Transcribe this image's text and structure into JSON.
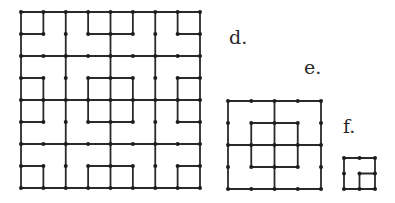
{
  "figures": {
    "d": {
      "label": "d.",
      "grid": {
        "n": 8,
        "x0": 21,
        "y0": 12,
        "x1": 200,
        "y1": 188
      },
      "segments": [
        [
          0,
          0,
          8,
          0
        ],
        [
          0,
          8,
          8,
          8
        ],
        [
          0,
          0,
          0,
          8
        ],
        [
          8,
          0,
          8,
          8
        ],
        [
          0,
          2,
          8,
          2
        ],
        [
          0,
          4,
          8,
          4
        ],
        [
          0,
          6,
          8,
          6
        ],
        [
          2,
          0,
          2,
          8
        ],
        [
          4,
          0,
          4,
          8
        ],
        [
          6,
          0,
          6,
          8
        ],
        [
          1,
          0,
          1,
          1
        ],
        [
          0,
          1,
          1,
          1
        ],
        [
          3,
          0,
          3,
          1
        ],
        [
          3,
          1,
          4,
          1
        ],
        [
          5,
          0,
          5,
          1
        ],
        [
          4,
          1,
          5,
          1
        ],
        [
          7,
          0,
          7,
          1
        ],
        [
          7,
          1,
          8,
          1
        ],
        [
          0,
          3,
          1,
          3
        ],
        [
          1,
          3,
          1,
          4
        ],
        [
          3,
          3,
          4,
          3
        ],
        [
          3,
          3,
          3,
          4
        ],
        [
          4,
          3,
          5,
          3
        ],
        [
          5,
          3,
          5,
          4
        ],
        [
          7,
          3,
          8,
          3
        ],
        [
          7,
          3,
          7,
          4
        ],
        [
          1,
          4,
          1,
          5
        ],
        [
          0,
          5,
          1,
          5
        ],
        [
          3,
          4,
          3,
          5
        ],
        [
          3,
          5,
          4,
          5
        ],
        [
          5,
          4,
          5,
          5
        ],
        [
          4,
          5,
          5,
          5
        ],
        [
          7,
          4,
          7,
          5
        ],
        [
          7,
          5,
          8,
          5
        ],
        [
          0,
          7,
          1,
          7
        ],
        [
          1,
          7,
          1,
          8
        ],
        [
          3,
          7,
          4,
          7
        ],
        [
          3,
          7,
          3,
          8
        ],
        [
          4,
          7,
          5,
          7
        ],
        [
          5,
          7,
          5,
          8
        ],
        [
          7,
          7,
          8,
          7
        ],
        [
          7,
          7,
          7,
          8
        ]
      ]
    },
    "e": {
      "label": "e.",
      "grid": {
        "n": 4,
        "x0": 228,
        "y0": 101,
        "x1": 321,
        "y1": 189
      },
      "segments": [
        [
          0,
          0,
          4,
          0
        ],
        [
          0,
          4,
          4,
          4
        ],
        [
          0,
          0,
          0,
          4
        ],
        [
          4,
          0,
          4,
          4
        ],
        [
          0,
          2,
          4,
          2
        ],
        [
          2,
          0,
          2,
          4
        ],
        [
          1,
          1,
          3,
          1
        ],
        [
          1,
          3,
          3,
          3
        ],
        [
          1,
          1,
          1,
          3
        ],
        [
          3,
          1,
          3,
          3
        ]
      ]
    },
    "f": {
      "label": "f.",
      "grid": {
        "n": 2,
        "x0": 344,
        "y0": 158,
        "x1": 375,
        "y1": 189
      },
      "segments": [
        [
          0,
          0,
          2,
          0
        ],
        [
          0,
          2,
          2,
          2
        ],
        [
          0,
          0,
          0,
          2
        ],
        [
          2,
          0,
          2,
          2
        ],
        [
          1,
          1,
          2,
          1
        ],
        [
          1,
          1,
          1,
          2
        ]
      ]
    }
  },
  "colors": {
    "ink": "#2a2a2a",
    "background": "#ffffff"
  }
}
